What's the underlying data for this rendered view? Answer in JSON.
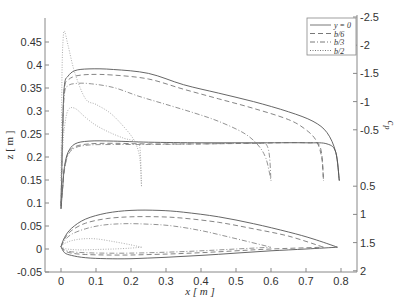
{
  "chart_data": {
    "type": "line",
    "title": "",
    "xlabel": "x [ m ]",
    "ylabel_left": "z [ m ]",
    "ylabel_right": "c_p",
    "xlim": [
      -0.045,
      0.845
    ],
    "ylim_left": [
      -0.05,
      0.5
    ],
    "ylim_right": [
      -2.5,
      2
    ],
    "right_axis_reversed": true,
    "grid": false,
    "legend_position": "upper right",
    "x_ticks": [
      "0",
      "0.1",
      "0.2",
      "0.3",
      "0.4",
      "0.5",
      "0.6",
      "0.7",
      "0.8"
    ],
    "x_tick_values": [
      0,
      0.1,
      0.2,
      0.3,
      0.4,
      0.5,
      0.6,
      0.7,
      0.8
    ],
    "y_left_ticks": [
      "-0.05",
      "0",
      "0.05",
      "0.1",
      "0.15",
      "0.2",
      "0.25",
      "0.3",
      "0.35",
      "0.4",
      "0.45"
    ],
    "y_left_tick_values": [
      -0.05,
      0,
      0.05,
      0.1,
      0.15,
      0.2,
      0.25,
      0.3,
      0.35,
      0.4,
      0.45
    ],
    "y_right_ticks": [
      "-2.5",
      "-2",
      "-1.5",
      "-1",
      "-0.5",
      "0.5",
      "1",
      "1.5",
      "2"
    ],
    "y_right_tick_values": [
      -2.5,
      -2,
      -1.5,
      -1,
      -0.5,
      0.5,
      1,
      1.5,
      2
    ],
    "series": [
      {
        "name": "y = 0",
        "style": "solid",
        "color": "#555555",
        "cp_upper": {
          "x": [
            0.0,
            0.005,
            0.01,
            0.02,
            0.04,
            0.08,
            0.15,
            0.25,
            0.35,
            0.45,
            0.55,
            0.65,
            0.72,
            0.76,
            0.785,
            0.795
          ],
          "cp": [
            0.9,
            -0.6,
            -1.3,
            -1.45,
            -1.55,
            -1.58,
            -1.57,
            -1.5,
            -1.3,
            -1.15,
            -1.0,
            -0.82,
            -0.65,
            -0.45,
            -0.1,
            0.4
          ]
        },
        "cp_lower": {
          "x": [
            0.0,
            0.005,
            0.01,
            0.02,
            0.04,
            0.08,
            0.15,
            0.25,
            0.4,
            0.55,
            0.7,
            0.76,
            0.785,
            0.795
          ],
          "cp": [
            0.9,
            0.5,
            0.15,
            -0.1,
            -0.25,
            -0.3,
            -0.3,
            -0.28,
            -0.27,
            -0.27,
            -0.27,
            -0.25,
            -0.1,
            0.4
          ]
        },
        "profile_upper": {
          "x": [
            0.0,
            0.01,
            0.03,
            0.07,
            0.13,
            0.2,
            0.28,
            0.35,
            0.45,
            0.55,
            0.65,
            0.72,
            0.79
          ],
          "z": [
            0.005,
            0.025,
            0.045,
            0.065,
            0.078,
            0.084,
            0.084,
            0.08,
            0.07,
            0.055,
            0.037,
            0.022,
            0.004
          ]
        },
        "profile_lower": {
          "x": [
            0.0,
            0.01,
            0.03,
            0.07,
            0.13,
            0.2,
            0.3,
            0.4,
            0.5,
            0.6,
            0.7,
            0.79
          ],
          "z": [
            0.005,
            -0.008,
            -0.014,
            -0.019,
            -0.021,
            -0.021,
            -0.018,
            -0.014,
            -0.009,
            -0.004,
            0.0,
            0.004
          ]
        }
      },
      {
        "name": "b/6",
        "style": "dashed",
        "color": "#666666",
        "cp_upper": {
          "x": [
            0.0,
            0.005,
            0.01,
            0.02,
            0.04,
            0.08,
            0.15,
            0.25,
            0.35,
            0.45,
            0.55,
            0.65,
            0.7,
            0.73,
            0.745,
            0.75
          ],
          "cp": [
            0.85,
            -0.6,
            -1.25,
            -1.38,
            -1.45,
            -1.48,
            -1.47,
            -1.4,
            -1.22,
            -1.05,
            -0.88,
            -0.68,
            -0.5,
            -0.3,
            0.0,
            0.4
          ]
        },
        "cp_lower": {
          "x": [
            0.0,
            0.005,
            0.01,
            0.02,
            0.04,
            0.08,
            0.15,
            0.25,
            0.4,
            0.55,
            0.7,
            0.74,
            0.75
          ],
          "cp": [
            0.85,
            0.5,
            0.18,
            -0.08,
            -0.2,
            -0.25,
            -0.26,
            -0.25,
            -0.25,
            -0.26,
            -0.27,
            -0.2,
            0.4
          ]
        },
        "profile_upper": {
          "x": [
            0.0,
            0.01,
            0.03,
            0.07,
            0.13,
            0.2,
            0.28,
            0.35,
            0.45,
            0.55,
            0.65,
            0.75
          ],
          "z": [
            0.005,
            0.022,
            0.04,
            0.056,
            0.066,
            0.07,
            0.07,
            0.067,
            0.058,
            0.044,
            0.028,
            0.004
          ]
        },
        "profile_lower": {
          "x": [
            0.0,
            0.01,
            0.03,
            0.07,
            0.13,
            0.2,
            0.3,
            0.4,
            0.5,
            0.6,
            0.75
          ],
          "z": [
            0.005,
            -0.004,
            -0.009,
            -0.012,
            -0.013,
            -0.013,
            -0.011,
            -0.008,
            -0.004,
            0.0,
            0.004
          ]
        }
      },
      {
        "name": "b/3",
        "style": "dashdot",
        "color": "#777777",
        "cp_upper": {
          "x": [
            0.0,
            0.005,
            0.01,
            0.02,
            0.04,
            0.08,
            0.15,
            0.22,
            0.3,
            0.38,
            0.45,
            0.52,
            0.56,
            0.585,
            0.6
          ],
          "cp": [
            0.8,
            -0.5,
            -1.15,
            -1.28,
            -1.32,
            -1.32,
            -1.25,
            -1.1,
            -0.95,
            -0.8,
            -0.65,
            -0.45,
            -0.25,
            0.0,
            0.4
          ]
        },
        "cp_lower": {
          "x": [
            0.0,
            0.005,
            0.01,
            0.02,
            0.04,
            0.08,
            0.15,
            0.25,
            0.4,
            0.55,
            0.59,
            0.6
          ],
          "cp": [
            0.8,
            0.45,
            0.2,
            -0.05,
            -0.18,
            -0.23,
            -0.24,
            -0.24,
            -0.25,
            -0.26,
            -0.2,
            0.4
          ]
        },
        "profile_upper": {
          "x": [
            0.0,
            0.01,
            0.03,
            0.07,
            0.12,
            0.18,
            0.25,
            0.32,
            0.4,
            0.48,
            0.6
          ],
          "z": [
            0.005,
            0.018,
            0.032,
            0.044,
            0.052,
            0.055,
            0.054,
            0.05,
            0.04,
            0.026,
            0.004
          ]
        },
        "profile_lower": {
          "x": [
            0.0,
            0.01,
            0.03,
            0.07,
            0.12,
            0.2,
            0.3,
            0.4,
            0.5,
            0.6
          ],
          "z": [
            0.005,
            -0.002,
            -0.006,
            -0.008,
            -0.009,
            -0.009,
            -0.007,
            -0.004,
            0.0,
            0.004
          ]
        }
      },
      {
        "name": "b/2",
        "style": "dotted",
        "color": "#999999",
        "cp_upper": {
          "x": [
            0.0,
            0.003,
            0.006,
            0.01,
            0.02,
            0.04,
            0.07,
            0.1,
            0.14,
            0.18,
            0.21,
            0.225,
            0.23
          ],
          "cp": [
            0.4,
            -1.5,
            -2.1,
            -2.25,
            -2.0,
            -1.5,
            -1.05,
            -0.95,
            -0.8,
            -0.55,
            -0.3,
            0.0,
            0.5
          ]
        },
        "cp_lower": {
          "x": [
            0.0,
            0.005,
            0.01,
            0.02,
            0.04,
            0.07,
            0.1,
            0.14,
            0.18,
            0.21,
            0.225,
            0.23
          ],
          "cp": [
            0.4,
            -0.2,
            -0.55,
            -0.85,
            -0.88,
            -0.72,
            -0.58,
            -0.45,
            -0.35,
            -0.3,
            -0.2,
            0.5
          ]
        },
        "profile_upper": {
          "x": [
            0.0,
            0.01,
            0.03,
            0.06,
            0.1,
            0.15,
            0.2,
            0.23
          ],
          "z": [
            0.005,
            0.012,
            0.018,
            0.022,
            0.022,
            0.016,
            0.009,
            0.004
          ]
        },
        "profile_lower": {
          "x": [
            0.0,
            0.01,
            0.03,
            0.06,
            0.1,
            0.15,
            0.2,
            0.23
          ],
          "z": [
            0.005,
            0.001,
            -0.001,
            -0.002,
            -0.001,
            0.0,
            0.002,
            0.004
          ]
        }
      }
    ]
  },
  "legend": {
    "items": [
      {
        "label": "y = 0",
        "style": "solid"
      },
      {
        "label": "b/6",
        "style": "dashed"
      },
      {
        "label": "b/3",
        "style": "dashdot"
      },
      {
        "label": "b/2",
        "style": "dotted"
      }
    ]
  },
  "axes": {
    "xlabel": "x [ m ]",
    "ylabel_left": "z [ m ]",
    "ylabel_right": "c",
    "ylabel_right_sub": "p"
  }
}
